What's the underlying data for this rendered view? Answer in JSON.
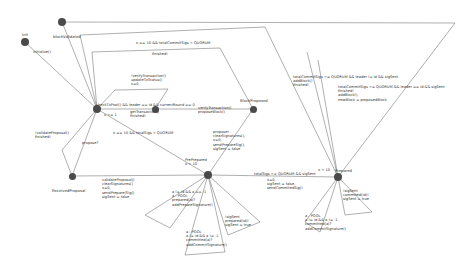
{
  "states": [
    {
      "id": "init",
      "name": "init",
      "x": 25,
      "y": 42,
      "r": 4
    },
    {
      "id": "blockValidated",
      "name": "blockValidated",
      "x": 62,
      "y": 22,
      "r": 4
    },
    {
      "id": "center",
      "name": "",
      "x": 97,
      "y": 109,
      "r": 4
    },
    {
      "id": "mid",
      "name": "",
      "x": 155,
      "y": 109,
      "r": 3.5
    },
    {
      "id": "BlockProposed",
      "name": "BlockProposed",
      "x": 253,
      "y": 109,
      "r": 3.5
    },
    {
      "id": "ReceivedProposal",
      "name": "ReceivedProposal",
      "x": 72,
      "y": 176,
      "r": 3.5
    },
    {
      "id": "PrePrepared",
      "name": "PrePrepared",
      "x": 208,
      "y": 175,
      "r": 4
    },
    {
      "id": "Prepared",
      "name": "Prepared",
      "x": 338,
      "y": 177,
      "r": 4
    }
  ],
  "labels": {
    "init": "init",
    "blockValidated": "blockValidated",
    "initialize": "initialize()",
    "top_guard": "x == 10 && totalCommitSigs < QUORUM",
    "top_finished": "finished!",
    "verify": "!verifyTransaction()\nupdateTxStatus()\nx=0",
    "check": "checkTxPool() && leader == id && currentRound == 0",
    "getTx": "getTransaction()\nfinished!",
    "xeq": "x <= 1",
    "mid_label": "verifyTransaction()\nproposeBlock()",
    "blockProposed": "BlockProposed",
    "x10_quorum": "x == 10 && totalSigs < QUORUM",
    "invalid": "!validateProposal()\nfinished!",
    "propose": "propose?",
    "receivedProposal": "ReceivedProposal",
    "validate": "validateProposal()\nclearSignatures()\nx=0,\nsendPrepare(Sig()\nsigSent = false",
    "proposer": "proposer\nclearSignatures(),\nx=0,\nsendPrepareSig(),\nsigSent = false",
    "prePrepared": "PrePrepared\nx < 10",
    "totalSigs": "totalSigs >= QUORUM && sigSent",
    "x10": "x < 10",
    "commitSend": "x=0,\nsigSent = false,\nsendCommitedSig()",
    "prepared": "Prepared",
    "commit_nonleader": "totalCommitSigs >= QUORUM && leader != id && sigSent\naddBlock()\nfinished!",
    "commit_leader": "totalCommitSigs >= QUORUM && leader == id && sigSent\nfinished!\naddBlock(),\nnewBlock = proposedBlock",
    "pp_loop1": "a != id && a == -1\na : POOL\nprepared(a)?\naddPrepareSignature()",
    "pp_loop2": "a : POOL\na != id && a != -1\ncommitted(a)?\naddCommitSignature()",
    "pp_loop3": "!sigSent\nprepared(id)!\nsigSent = true",
    "pr_loop1": "!sigSent\ncommited(id)!\nsigSent = true",
    "pr_loop2": "a : POOL\na != id && a != -1\ncommitted(a)?\naddCommitSignature()"
  }
}
